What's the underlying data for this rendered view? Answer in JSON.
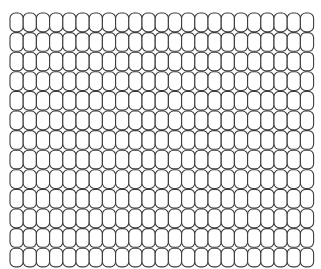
{
  "canvas": {
    "width": 321,
    "height": 269,
    "background_color": "#ffffff",
    "description": "Tiled grid of outlined rounded rectangles"
  },
  "pattern": {
    "name": "rounded-rectangle-tiling",
    "shape": "rounded-rectangle",
    "columns": 23,
    "rows": 13,
    "origin_x": 10,
    "origin_y": 13,
    "cell_width": 13.2,
    "cell_height": 18.7,
    "tile_width": 13.2,
    "tile_height": 19.6,
    "corner_radius": 5.2,
    "stroke_color": "#3c3c3c",
    "stroke_width": 1.1,
    "fill_color": "#ffffff",
    "total_tiles": 299,
    "aligned": "grid",
    "stagger": "none"
  }
}
